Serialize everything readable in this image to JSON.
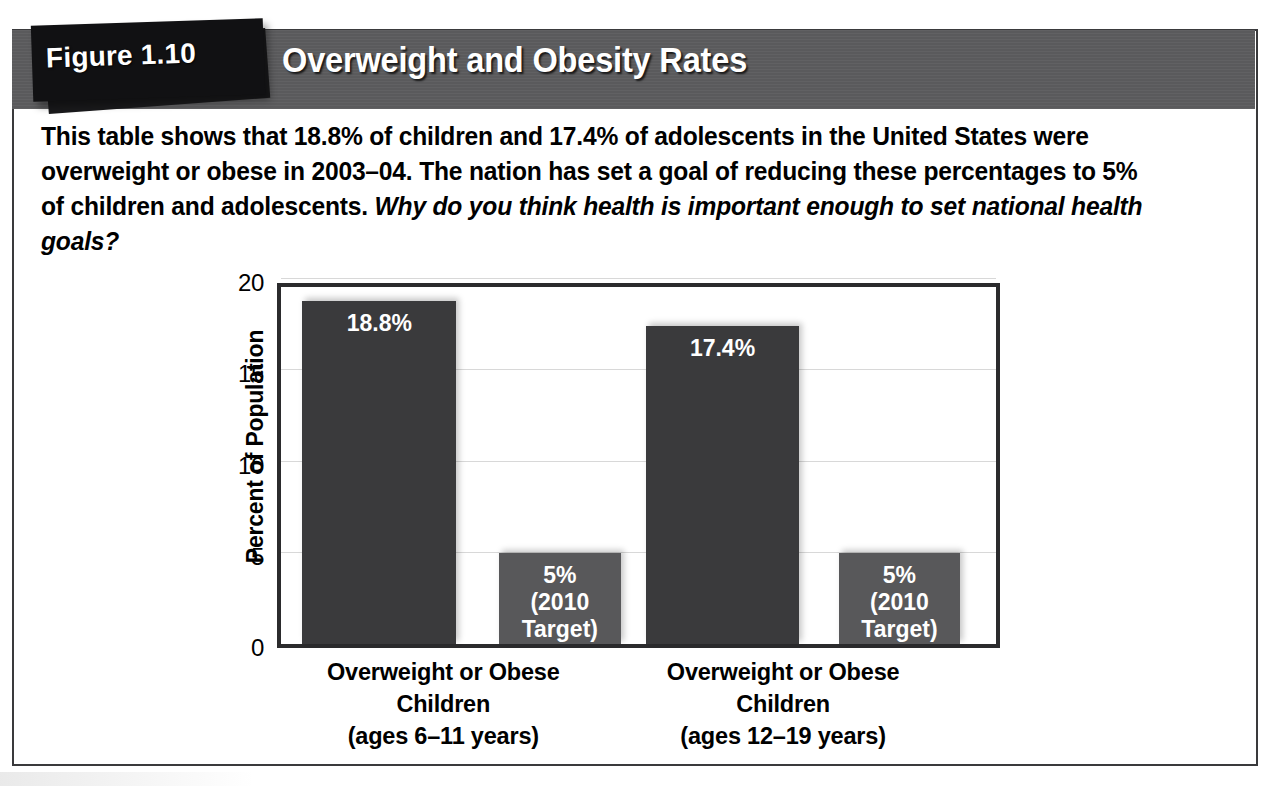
{
  "figure": {
    "tab_label": "Figure 1.10",
    "title": "Overweight and Obesity Rates",
    "caption_part1": "This table shows that 18.8% of children and 17.4% of adolescents in the United States were overweight or obese in 2003–04. The nation has set a goal of reducing these percentages to 5% of children and adolescents. ",
    "caption_question": "Why do you think health is important enough to set national health goals?",
    "colors": {
      "header_band": "#5a5a5c",
      "tab": "#111113",
      "bar_dark": "#3a3a3c",
      "bar_light": "#58585a",
      "plot_border": "#2b2b2d",
      "gridline": "#d8d8d8",
      "text": "#000000",
      "title_text": "#ffffff"
    }
  },
  "chart_data": {
    "type": "bar",
    "title": "Overweight and Obesity Rates",
    "xlabel": "",
    "ylabel": "Percent of Population",
    "ylim": [
      0,
      20
    ],
    "yticks": [
      0,
      5,
      10,
      15,
      20
    ],
    "ytick_labels": [
      "0",
      "5",
      "10",
      "15",
      "20"
    ],
    "grid": true,
    "legend": "none",
    "categories": [
      "Overweight or Obese\nChildren\n(ages 6–11 years)",
      "Overweight or Obese\nChildren\n(ages 12–19 years)"
    ],
    "series": [
      {
        "name": "Actual (2003–04)",
        "values": [
          18.8,
          17.4
        ],
        "color": "#3a3a3c"
      },
      {
        "name": "2010 Target",
        "values": [
          5,
          5
        ],
        "color": "#58585a"
      }
    ],
    "bars": [
      {
        "value": 18.8,
        "label": "18.8%",
        "style": "dark",
        "group": 0,
        "left_pct": 3.0,
        "width_pct": 21.5
      },
      {
        "value": 5.0,
        "label": "5%\n(2010\nTarget)",
        "style": "light",
        "group": 0,
        "left_pct": 30.5,
        "width_pct": 17.0
      },
      {
        "value": 17.4,
        "label": "17.4%",
        "style": "dark",
        "group": 1,
        "left_pct": 51.0,
        "width_pct": 21.5
      },
      {
        "value": 5.0,
        "label": "5%\n(2010\nTarget)",
        "style": "light",
        "group": 1,
        "left_pct": 78.0,
        "width_pct": 17.0
      }
    ],
    "xtick_positions_pct": [
      23.0,
      70.0
    ]
  }
}
